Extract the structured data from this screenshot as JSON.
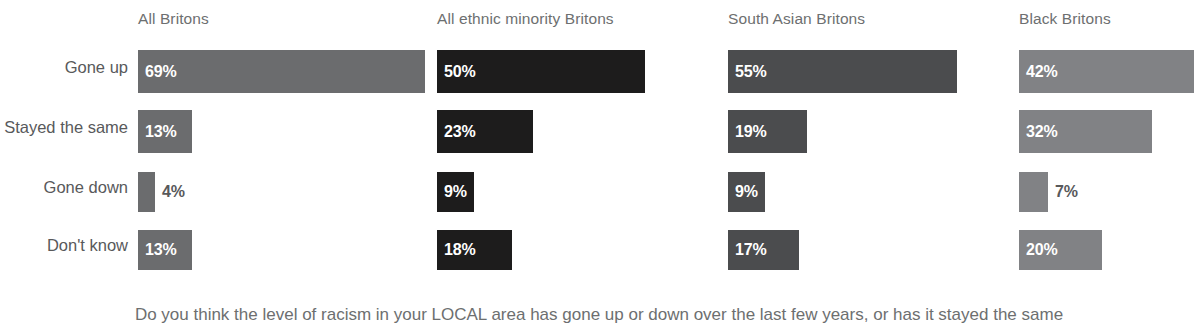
{
  "chart_data": {
    "type": "bar",
    "title": "",
    "subtitle": "",
    "caption": "Do you think the level of racism in your LOCAL area has gone up or down over the last few years, or has it stayed the same",
    "xlabel": "",
    "ylabel": "",
    "xlim": [
      0,
      69
    ],
    "grid": false,
    "legend_position": "none",
    "orientation": "horizontal",
    "value_suffix": "%",
    "categories": [
      "Gone up",
      "Stayed the same",
      "Gone down",
      "Don't know"
    ],
    "series": [
      {
        "name": "All Britons",
        "color": "#6b6c6e",
        "values": [
          69,
          13,
          4,
          13
        ],
        "labels": [
          "69%",
          "13%",
          "4%",
          "13%"
        ],
        "label_inside": [
          true,
          true,
          false,
          true
        ]
      },
      {
        "name": "All ethnic minority Britons",
        "color": "#1d1c1c",
        "values": [
          50,
          23,
          9,
          18
        ],
        "labels": [
          "50%",
          "23%",
          "9%",
          "18%"
        ],
        "label_inside": [
          true,
          true,
          true,
          true
        ]
      },
      {
        "name": "South Asian Britons",
        "color": "#4b4c4e",
        "values": [
          55,
          19,
          9,
          17
        ],
        "labels": [
          "55%",
          "19%",
          "9%",
          "17%"
        ],
        "label_inside": [
          true,
          true,
          true,
          true
        ]
      },
      {
        "name": "Black Britons",
        "color": "#818285",
        "values": [
          42,
          32,
          7,
          20
        ],
        "labels": [
          "42%",
          "32%",
          "7%",
          "20%"
        ],
        "label_inside": [
          true,
          true,
          false,
          true
        ]
      }
    ]
  },
  "colors": {
    "background": "#ffffff",
    "row_label": "#58595b",
    "column_header": "#6d6f70",
    "value_inside": "#ffffff",
    "value_outside": "#58595b",
    "caption": "#6d6f70"
  },
  "row_labels": {
    "gone_up": "Gone up",
    "stayed_the_same": "Stayed the same",
    "gone_down": "Gone down",
    "dont_know": "Don't know"
  },
  "column_headers": {
    "all_britons": "All Britons",
    "all_ethnic_minority_britons": "All ethnic minority Britons",
    "south_asian_britons": "South Asian Britons",
    "black_britons": "Black Britons"
  }
}
